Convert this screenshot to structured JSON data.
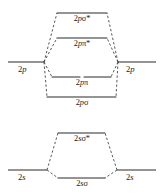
{
  "diagram": {
    "type": "molecular-orbital-energy-diagram",
    "title": "",
    "width": 162,
    "height": 195,
    "line_color": "#2b2b2b",
    "dash_color": "#3a3a3a",
    "background": "#ffffff",
    "groups": [
      {
        "name": "2p-block",
        "atomic_left": {
          "label_n": "2",
          "label_orbital": "p",
          "label": "2p",
          "x1": 8,
          "x2": 44,
          "y": 62
        },
        "atomic_right": {
          "label_n": "2",
          "label_orbital": "p",
          "label": "2p",
          "x1": 118,
          "x2": 156,
          "y": 62
        },
        "molecular_levels": [
          {
            "name": "2p-sigma-star",
            "n": "2",
            "orbital": "p",
            "greek": "σ",
            "star": "*",
            "label": "2pσ*",
            "y": 13,
            "x1": 57,
            "x2": 107,
            "split": false,
            "label_y": 15
          },
          {
            "name": "2p-pi-star",
            "n": "2",
            "orbital": "p",
            "greek": "π",
            "star": "*",
            "label": "2pπ*",
            "y": 38,
            "x1": 57,
            "x2": 107,
            "split": false,
            "label_y": 40
          },
          {
            "name": "2p-pi",
            "n": "2",
            "orbital": "p",
            "greek": "π",
            "star": "",
            "label": "2pπ",
            "y": 77,
            "x1": 52,
            "x2": 111,
            "split": true,
            "label_y": 79
          },
          {
            "name": "2p-sigma",
            "n": "2",
            "orbital": "p",
            "greek": "σ",
            "star": "",
            "label": "2pσ",
            "y": 97,
            "x1": 47,
            "x2": 116,
            "split": false,
            "label_y": 99
          }
        ]
      },
      {
        "name": "2s-block",
        "atomic_left": {
          "label_n": "2",
          "label_orbital": "s",
          "label": "2s",
          "x1": 8,
          "x2": 47,
          "y": 170
        },
        "atomic_right": {
          "label_n": "2",
          "label_orbital": "s",
          "label": "2s",
          "x1": 117,
          "x2": 156,
          "y": 170
        },
        "molecular_levels": [
          {
            "name": "2s-sigma-star",
            "n": "2",
            "orbital": "s",
            "greek": "σ",
            "star": "*",
            "label": "2sσ*",
            "y": 133,
            "x1": 58,
            "x2": 105,
            "split": false,
            "label_y": 135
          },
          {
            "name": "2s-sigma",
            "n": "2",
            "orbital": "s",
            "greek": "σ",
            "star": "",
            "label": "2sσ",
            "y": 178,
            "x1": 58,
            "x2": 105,
            "split": false,
            "label_y": 180
          }
        ]
      }
    ],
    "atomic_labels": {
      "p_left": {
        "text": "2p",
        "n": "2",
        "orb": "p",
        "x": 24,
        "y": 66
      },
      "p_right": {
        "text": "2p",
        "n": "2",
        "orb": "p",
        "x": 131,
        "y": 66
      },
      "s_left": {
        "text": "2s",
        "n": "2",
        "orb": "s",
        "x": 24,
        "y": 174
      },
      "s_right": {
        "text": "2s",
        "n": "2",
        "orb": "s",
        "x": 130,
        "y": 174
      }
    }
  }
}
